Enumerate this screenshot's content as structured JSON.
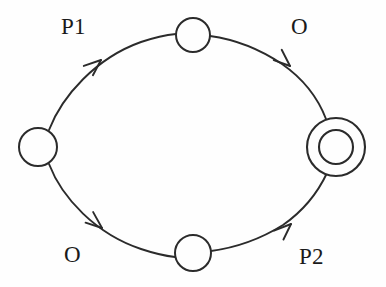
{
  "diagram": {
    "type": "state-transition-diagram",
    "background_color": "#fefefe",
    "stroke_color": "#2b2b2b",
    "text_color": "#1a1a1a",
    "nodes": [
      {
        "id": "start",
        "kind": "circle",
        "role": "start-state",
        "cx": 38,
        "cy": 147,
        "r": 19,
        "label": ""
      },
      {
        "id": "top",
        "kind": "circle",
        "role": "intermediate-state",
        "cx": 193,
        "cy": 35,
        "r": 17,
        "label": ""
      },
      {
        "id": "bottom",
        "kind": "circle",
        "role": "intermediate-state",
        "cx": 193,
        "cy": 253,
        "r": 18,
        "label": ""
      },
      {
        "id": "final",
        "kind": "double-circle",
        "role": "final-state",
        "cx": 336,
        "cy": 147,
        "r_outer": 29,
        "r_inner": 17,
        "label": ""
      }
    ],
    "edges": [
      {
        "id": "edge-start-top",
        "from": "start",
        "to": "top",
        "label": "P1",
        "direction": "clockwise",
        "arrow_at": {
          "x": 100,
          "y": 61
        },
        "arrow_angle_deg": -42
      },
      {
        "id": "edge-top-final",
        "from": "top",
        "to": "final",
        "label": "O",
        "direction": "clockwise",
        "arrow_at": {
          "x": 288,
          "y": 63
        },
        "arrow_angle_deg": 43
      },
      {
        "id": "edge-start-bottom",
        "from": "start",
        "to": "bottom",
        "label": "O",
        "direction": "counterclockwise",
        "arrow_at": {
          "x": 100,
          "y": 231
        },
        "arrow_angle_deg": 42
      },
      {
        "id": "edge-bottom-final",
        "from": "bottom",
        "to": "final",
        "label": "P2",
        "direction": "counterclockwise",
        "arrow_at": {
          "x": 289,
          "y": 228
        },
        "arrow_angle_deg": -42
      }
    ],
    "labels": {
      "p1": "P1",
      "o_top": "O",
      "o_bottom": "O",
      "p2": "P2"
    }
  }
}
